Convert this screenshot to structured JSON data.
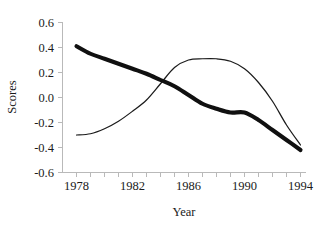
{
  "chart_data": {
    "type": "line",
    "title": "",
    "xlabel": "Year",
    "ylabel": "Scores",
    "xlim": [
      1977.6,
      1994.4
    ],
    "ylim": [
      -0.6,
      0.6
    ],
    "grid": false,
    "legend": "none",
    "x_tick_labels": [
      "1978",
      "1982",
      "1986",
      "1990",
      "1994"
    ],
    "x_tick_values": [
      1978,
      1982,
      1986,
      1990,
      1994
    ],
    "x_minor_tick_interval": 1,
    "y_tick_labels": [
      "0.6",
      "0.4",
      "0.2",
      "0.0",
      "-0.2",
      "-0.4",
      "-0.6"
    ],
    "y_tick_values": [
      0.6,
      0.4,
      0.2,
      0.0,
      -0.2,
      -0.4,
      -0.6
    ],
    "x": [
      1978,
      1979,
      1980,
      1981,
      1982,
      1983,
      1984,
      1985,
      1986,
      1987,
      1988,
      1989,
      1990,
      1991,
      1992,
      1993,
      1994
    ],
    "series": [
      {
        "name": "thick-line",
        "style": "thick",
        "values": [
          0.41,
          0.35,
          0.31,
          0.27,
          0.23,
          0.19,
          0.14,
          0.09,
          0.02,
          -0.05,
          -0.09,
          -0.12,
          -0.12,
          -0.18,
          -0.26,
          -0.34,
          -0.42
        ]
      },
      {
        "name": "thin-line",
        "style": "thin",
        "values": [
          -0.3,
          -0.29,
          -0.25,
          -0.19,
          -0.11,
          -0.02,
          0.11,
          0.24,
          0.3,
          0.31,
          0.31,
          0.29,
          0.23,
          0.12,
          -0.03,
          -0.22,
          -0.38
        ]
      }
    ]
  },
  "colors": {
    "thick_series": "#101010",
    "thin_series": "#1b1b1b",
    "axis": "#b9b9b9",
    "text": "#1a1a1a",
    "background": "#ffffff"
  }
}
